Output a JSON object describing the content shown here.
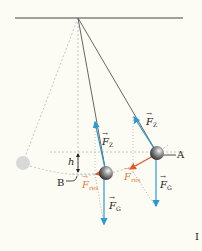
{
  "figure": {
    "colors": {
      "background": "#fdfcf4",
      "string": "#555555",
      "force_blue": "#2a9ad0",
      "force_red": "#e05a28",
      "label_red": "#e07a3c",
      "dashed": "#b5b5b5",
      "ghost_ball": "#d8d8d8"
    },
    "labels": {
      "point_a": "A",
      "point_b": "B",
      "height": "h",
      "fz_right": "F",
      "fz_right_sub": "Z",
      "fz_left": "F",
      "fz_left_sub": "Z",
      "fg_right": "F",
      "fg_right_sub": "G",
      "fg_left": "F",
      "fg_left_sub": "G",
      "fres_right": "F",
      "fres_right_sub": "res",
      "fres_left": "F",
      "fres_left_sub": "res",
      "vector_arrow": "→",
      "roman_numeral": "I"
    },
    "geometry": {
      "pivot": [
        78,
        18
      ],
      "ceiling": [
        15,
        183
      ],
      "ball_a": [
        157,
        153
      ],
      "ball_b": [
        106,
        173
      ],
      "ghost_ball": [
        23,
        163
      ],
      "ball_radius": 7
    }
  }
}
